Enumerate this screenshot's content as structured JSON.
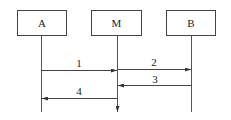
{
  "diagram": {
    "type": "sequence",
    "participants": [
      {
        "id": "A",
        "label": "A"
      },
      {
        "id": "M",
        "label": "M"
      },
      {
        "id": "B",
        "label": "B"
      }
    ],
    "messages": [
      {
        "label": "1",
        "from": "A",
        "to": "M"
      },
      {
        "label": "2",
        "from": "M",
        "to": "B"
      },
      {
        "label": "3",
        "from": "B",
        "to": "M"
      },
      {
        "label": "4",
        "from": "M",
        "to": "A"
      }
    ],
    "colors": {
      "line": "#444444",
      "background": "#ffffff"
    }
  }
}
